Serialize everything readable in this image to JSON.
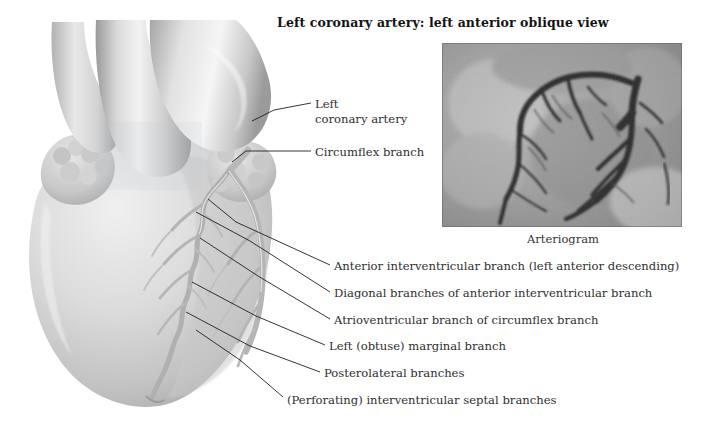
{
  "figure": {
    "title": "Left coronary artery: left anterior oblique view",
    "background_color": "#ffffff",
    "text_color": "#2e2e2e"
  },
  "illustration": {
    "name": "heart-anatomical-illustration",
    "description": "Grayscale anatomical drawing of the heart seen in left anterior oblique view showing the left coronary artery and its branches"
  },
  "arteriogram": {
    "caption": "Arteriogram",
    "name": "coronary-arteriogram-image",
    "description": "Grayscale radiographic coronary angiogram showing contrast-filled left coronary artery branches"
  },
  "labels": [
    {
      "id": "left-coronary-artery",
      "line1": "Left",
      "line2": "coronary artery"
    },
    {
      "id": "circumflex-branch",
      "line1": "Circumflex branch",
      "line2": ""
    },
    {
      "id": "anterior-interventricular-branch",
      "line1": "Anterior interventricular branch (left anterior descending)",
      "line2": ""
    },
    {
      "id": "diagonal-branches",
      "line1": "Diagonal branches of anterior interventricular branch",
      "line2": ""
    },
    {
      "id": "atrioventricular-branch",
      "line1": "Atrioventricular branch of circumflex branch",
      "line2": ""
    },
    {
      "id": "left-obtuse-marginal-branch",
      "line1": "Left (obtuse) marginal branch",
      "line2": ""
    },
    {
      "id": "posterolateral-branches",
      "line1": "Posterolateral branches",
      "line2": ""
    },
    {
      "id": "perforating-septal-branches",
      "line1": "(Perforating) interventricular septal branches",
      "line2": ""
    }
  ]
}
